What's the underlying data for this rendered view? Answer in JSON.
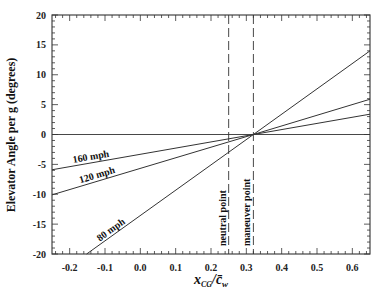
{
  "chart_data": {
    "type": "line",
    "title": "",
    "xlabel": "x_CG / c̄_w",
    "xlabel_parts": {
      "main": "x",
      "sub": "CG",
      "sep": "/",
      "den": "c̄",
      "den_sub": "w"
    },
    "ylabel": "Elevator Angle per g (degrees)",
    "xlim": [
      -0.25,
      0.65
    ],
    "ylim": [
      -20,
      20
    ],
    "xticks": [
      "-0.2",
      "-0.1",
      "0.0",
      "0.1",
      "0.2",
      "0.3",
      "0.4",
      "0.5",
      "0.6"
    ],
    "xtick_values": [
      -0.2,
      -0.1,
      0.0,
      0.1,
      0.2,
      0.3,
      0.4,
      0.5,
      0.6
    ],
    "yticks": [
      "-20",
      "-15",
      "-10",
      "-5",
      "0",
      "5",
      "10",
      "15",
      "20"
    ],
    "ytick_values": [
      -20,
      -15,
      -10,
      -5,
      0,
      5,
      10,
      15,
      20
    ],
    "grid": false,
    "series": [
      {
        "name": "160 mph",
        "x": [
          -0.25,
          0.32,
          0.65
        ],
        "y": [
          -5.9,
          0,
          3.4
        ]
      },
      {
        "name": "120 mph",
        "x": [
          -0.25,
          0.32,
          0.65
        ],
        "y": [
          -10.1,
          0,
          5.9
        ]
      },
      {
        "name": "80 mph",
        "x": [
          -0.152,
          0.32,
          0.65
        ],
        "y": [
          -20,
          0,
          14
        ]
      }
    ],
    "reference_lines": [
      {
        "type": "horizontal",
        "y": 0,
        "style": "solid"
      },
      {
        "type": "vertical",
        "x": 0.25,
        "style": "dashed",
        "label": "neutral point"
      },
      {
        "type": "vertical",
        "x": 0.32,
        "style": "dashed",
        "label": "maneuver point"
      }
    ],
    "annotations": [
      "160 mph",
      "120 mph",
      "80 mph",
      "neutral point",
      "maneuver point"
    ]
  },
  "colors": {
    "line": "#333333",
    "frame": "#444444",
    "text": "#111111"
  }
}
